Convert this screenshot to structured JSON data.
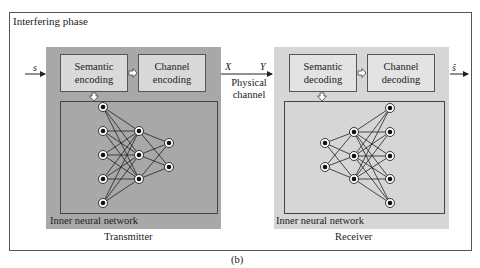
{
  "figure": {
    "phase_title": "Interfering phase",
    "caption": "(b)",
    "input_symbol": "s",
    "output_symbol": "ŝ",
    "channel": {
      "tx_symbol": "X",
      "rx_symbol": "Y",
      "label_line1": "Physical",
      "label_line2": "channel"
    },
    "transmitter": {
      "label": "Transmitter",
      "background": "#a8a8a8",
      "blocks": [
        {
          "line1": "Semantic",
          "line2": "encoding"
        },
        {
          "line1": "Channel",
          "line2": "encoding"
        }
      ],
      "inner_label": "Inner neural network",
      "network_layers": [
        5,
        3,
        2
      ]
    },
    "receiver": {
      "label": "Receiver",
      "background": "#d6d6d6",
      "blocks": [
        {
          "line1": "Semantic",
          "line2": "decoding"
        },
        {
          "line1": "Channel",
          "line2": "decoding"
        }
      ],
      "inner_label": "Inner neural network",
      "network_layers": [
        2,
        3,
        5
      ]
    }
  }
}
